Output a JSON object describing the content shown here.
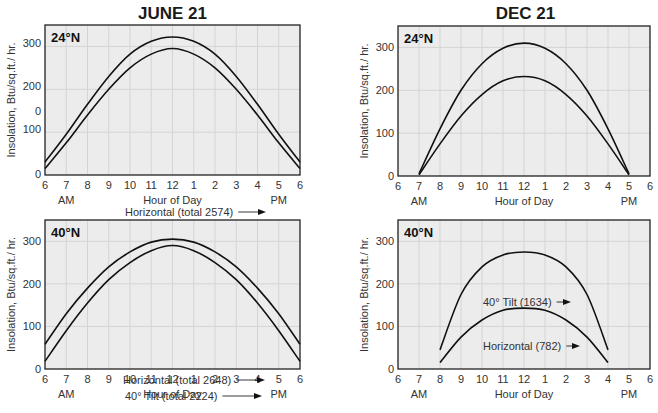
{
  "columns": [
    {
      "title": "JUNE 21"
    },
    {
      "title": "DEC 21"
    }
  ],
  "y_axis_label": "Insolation, Btu/sq.ft./ hr.",
  "x_axis_label": "Hour of Day",
  "am_label": "AM",
  "pm_label": "PM",
  "x_ticks": [
    "6",
    "7",
    "8",
    "9",
    "10",
    "11",
    "12",
    "1",
    "2",
    "3",
    "4",
    "5",
    "6"
  ],
  "y_ticks_june24": [
    "300",
    "200",
    "0",
    "100",
    "0"
  ],
  "y_ticks": [
    "300",
    "200",
    "100",
    "0"
  ],
  "chart_data": [
    {
      "type": "line",
      "title": "JUNE 21",
      "panel_label": "24°N",
      "xlabel": "Hour of Day",
      "ylabel": "Insolation, Btu/sq.ft./ hr.",
      "x_ticks": [
        "6 AM",
        "7",
        "8",
        "9",
        "10",
        "11",
        "12",
        "1",
        "2",
        "3",
        "4",
        "5",
        "6 PM"
      ],
      "y_ticks": [
        "0",
        "100",
        "0",
        "200",
        "300"
      ],
      "ylim": [
        0,
        350
      ],
      "grid": true,
      "x": [
        6,
        7,
        8,
        9,
        10,
        11,
        12,
        13,
        14,
        15,
        16,
        17,
        18
      ],
      "series": [
        {
          "name": "Horizontal (total 2574)",
          "values": [
            30,
            95,
            165,
            230,
            282,
            312,
            322,
            312,
            282,
            230,
            165,
            95,
            30
          ]
        },
        {
          "name": "24° Tilt (total 2230)",
          "values": [
            15,
            75,
            140,
            200,
            250,
            282,
            295,
            282,
            250,
            200,
            140,
            75,
            15
          ]
        }
      ],
      "annotations": [
        "Horizontal (total 2574)",
        "24° Tilt (total 2230)"
      ]
    },
    {
      "type": "line",
      "title": "DEC 21",
      "panel_label": "24°N",
      "xlabel": "Hour of Day",
      "ylabel": "Insolation, Btu/sq.ft./ hr.",
      "x_ticks": [
        "6 AM",
        "7",
        "8",
        "9",
        "10",
        "11",
        "12",
        "1",
        "2",
        "3",
        "4",
        "5",
        "6 PM"
      ],
      "y_ticks": [
        "0",
        "100",
        "200",
        "300"
      ],
      "ylim": [
        0,
        350
      ],
      "grid": true,
      "x": [
        7,
        8,
        9,
        10,
        11,
        12,
        13,
        14,
        15,
        16,
        17
      ],
      "series": [
        {
          "name": "24° Tilt (2058)",
          "values": [
            5,
            110,
            200,
            262,
            298,
            310,
            298,
            262,
            200,
            110,
            5
          ]
        },
        {
          "name": "Horizontal (1474)",
          "values": [
            3,
            75,
            140,
            190,
            222,
            232,
            222,
            190,
            140,
            75,
            3
          ]
        }
      ],
      "annotations": [
        "24° Tilt (2058)",
        "Horizontal (1474)"
      ]
    },
    {
      "type": "line",
      "title": "JUNE 21",
      "panel_label": "40°N",
      "xlabel": "Hour of Day",
      "ylabel": "Insolation, Btu/sq.ft./ hr.",
      "x_ticks": [
        "6 AM",
        "7",
        "8",
        "9",
        "10",
        "11",
        "12",
        "1",
        "2",
        "3",
        "4",
        "5",
        "6 PM"
      ],
      "y_ticks": [
        "0",
        "100",
        "200",
        "300"
      ],
      "ylim": [
        0,
        350
      ],
      "grid": true,
      "x": [
        6,
        7,
        8,
        9,
        10,
        11,
        12,
        13,
        14,
        15,
        16,
        17,
        18
      ],
      "series": [
        {
          "name": "Horizontal (total 2648)",
          "values": [
            58,
            130,
            190,
            240,
            275,
            298,
            305,
            298,
            275,
            240,
            190,
            130,
            58
          ]
        },
        {
          "name": "40° Tilt (total 2224)",
          "values": [
            18,
            90,
            155,
            210,
            250,
            278,
            290,
            278,
            250,
            210,
            155,
            90,
            18
          ]
        }
      ],
      "annotations": [
        "Horizontal (total 2648)",
        "40° Tilt (total 2224)"
      ]
    },
    {
      "type": "line",
      "title": "DEC 21",
      "panel_label": "40°N",
      "xlabel": "Hour of Day",
      "ylabel": "Insolation, Btu/sq.ft./ hr.",
      "x_ticks": [
        "6 AM",
        "7",
        "8",
        "9",
        "10",
        "11",
        "12",
        "1",
        "2",
        "3",
        "4",
        "5",
        "6 PM"
      ],
      "y_ticks": [
        "0",
        "100",
        "200",
        "300"
      ],
      "ylim": [
        0,
        350
      ],
      "grid": true,
      "x": [
        8,
        9,
        10,
        11,
        12,
        13,
        14,
        15,
        16
      ],
      "series": [
        {
          "name": "40° Tilt (1634)",
          "values": [
            45,
            175,
            240,
            268,
            275,
            268,
            240,
            175,
            45
          ]
        },
        {
          "name": "Horizontal (782)",
          "values": [
            15,
            75,
            115,
            138,
            143,
            138,
            115,
            75,
            15
          ]
        }
      ],
      "annotations": [
        "40° Tilt (1634)",
        "Horizontal (782)"
      ]
    }
  ]
}
